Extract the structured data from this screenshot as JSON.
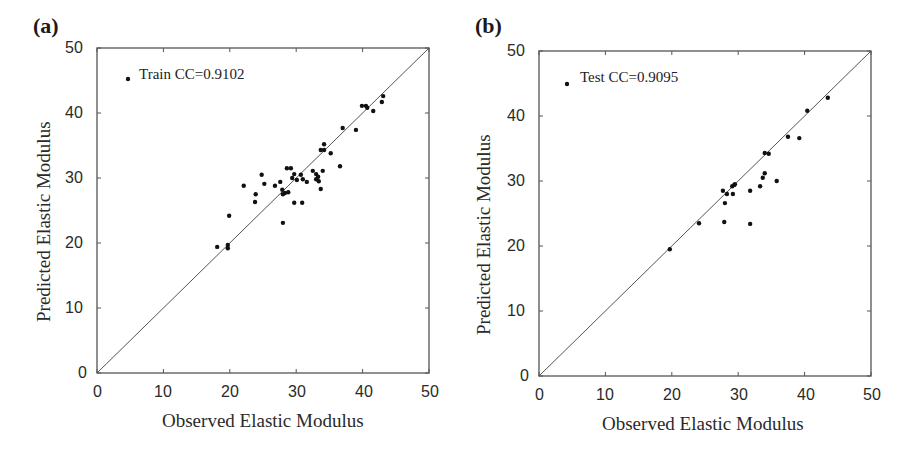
{
  "figure": {
    "panels": [
      {
        "letter": "(a)",
        "legend": "Train CC=0.9102",
        "xlabel": "Observed Elastic Modulus",
        "ylabel": "Predicted Elastic Modulus",
        "xticks": [
          "0",
          "10",
          "20",
          "30",
          "40",
          "50"
        ],
        "yticks": [
          "0",
          "10",
          "20",
          "30",
          "40",
          "50"
        ]
      },
      {
        "letter": "(b)",
        "legend": "Test CC=0.9095",
        "xlabel": "Observed Elastic Modulus",
        "ylabel": "Predicted Elastic Modulus",
        "xticks": [
          "0",
          "10",
          "20",
          "30",
          "40",
          "50"
        ],
        "yticks": [
          "0",
          "10",
          "20",
          "30",
          "40",
          "50"
        ]
      }
    ],
    "colors": {
      "axis": "#555555",
      "point": "#111111",
      "line": "#555555"
    }
  },
  "chart_data": [
    {
      "type": "scatter",
      "title": "(a)",
      "legend": [
        "Train CC=0.9102"
      ],
      "xlabel": "Observed Elastic Modulus",
      "ylabel": "Predicted Elastic Modulus",
      "xlim": [
        0,
        50
      ],
      "ylim": [
        0,
        50
      ],
      "grid": false,
      "reference_line": {
        "type": "y=x",
        "from": [
          0,
          0
        ],
        "to": [
          50,
          50
        ]
      },
      "series": [
        {
          "name": "Train",
          "points": [
            [
              18.1,
              19.4
            ],
            [
              19.7,
              19.7
            ],
            [
              19.7,
              19.2
            ],
            [
              28.0,
              23.1
            ],
            [
              19.9,
              24.2
            ],
            [
              22.1,
              28.8
            ],
            [
              24.8,
              30.5
            ],
            [
              25.2,
              29.1
            ],
            [
              23.9,
              27.5
            ],
            [
              23.8,
              26.3
            ],
            [
              26.8,
              28.8
            ],
            [
              27.6,
              29.4
            ],
            [
              27.9,
              28.2
            ],
            [
              28.3,
              27.7
            ],
            [
              28.8,
              27.8
            ],
            [
              28.0,
              27.5
            ],
            [
              28.6,
              31.5
            ],
            [
              29.2,
              31.5
            ],
            [
              29.7,
              30.6
            ],
            [
              30.7,
              30.5
            ],
            [
              29.4,
              30.0
            ],
            [
              30.1,
              29.7
            ],
            [
              31.0,
              29.8
            ],
            [
              31.6,
              29.4
            ],
            [
              32.5,
              31.1
            ],
            [
              33.0,
              30.6
            ],
            [
              33.3,
              30.2
            ],
            [
              33.0,
              29.8
            ],
            [
              33.4,
              29.5
            ],
            [
              34.0,
              31.1
            ],
            [
              33.7,
              28.3
            ],
            [
              29.7,
              26.2
            ],
            [
              30.9,
              26.2
            ],
            [
              34.2,
              35.2
            ],
            [
              33.7,
              34.3
            ],
            [
              34.2,
              34.3
            ],
            [
              35.2,
              33.8
            ],
            [
              36.6,
              31.8
            ],
            [
              37.0,
              37.7
            ],
            [
              39.0,
              37.4
            ],
            [
              39.9,
              41.1
            ],
            [
              40.5,
              41.1
            ],
            [
              40.7,
              40.8
            ],
            [
              41.6,
              40.3
            ],
            [
              42.9,
              41.7
            ],
            [
              43.1,
              42.6
            ]
          ]
        }
      ]
    },
    {
      "type": "scatter",
      "title": "(b)",
      "legend": [
        "Test CC=0.9095"
      ],
      "xlabel": "Observed Elastic Modulus",
      "ylabel": "Predicted Elastic Modulus",
      "xlim": [
        0,
        50
      ],
      "ylim": [
        0,
        50
      ],
      "grid": false,
      "reference_line": {
        "type": "y=x",
        "from": [
          0,
          0
        ],
        "to": [
          50,
          50
        ]
      },
      "series": [
        {
          "name": "Test",
          "points": [
            [
              19.7,
              19.5
            ],
            [
              24.1,
              23.5
            ],
            [
              27.9,
              23.7
            ],
            [
              31.8,
              23.4
            ],
            [
              28.0,
              26.6
            ],
            [
              27.7,
              28.5
            ],
            [
              28.3,
              28.0
            ],
            [
              29.2,
              28.0
            ],
            [
              29.1,
              29.2
            ],
            [
              29.4,
              29.4
            ],
            [
              29.5,
              29.5
            ],
            [
              31.8,
              28.5
            ],
            [
              33.3,
              29.2
            ],
            [
              33.7,
              30.5
            ],
            [
              34.0,
              31.2
            ],
            [
              35.8,
              30.0
            ],
            [
              34.0,
              34.3
            ],
            [
              34.6,
              34.2
            ],
            [
              37.5,
              36.8
            ],
            [
              39.2,
              36.6
            ],
            [
              40.4,
              40.8
            ],
            [
              43.5,
              42.8
            ]
          ]
        }
      ]
    }
  ]
}
